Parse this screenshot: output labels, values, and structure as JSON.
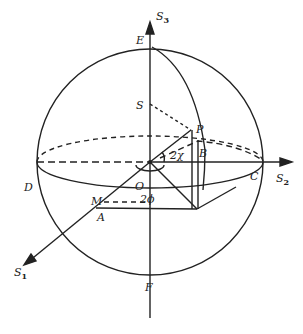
{
  "diagram": {
    "colors": {
      "ink": "#222222",
      "background": "#ffffff"
    },
    "axes": {
      "s1": {
        "main": "S",
        "sub": "1"
      },
      "s2": {
        "main": "S",
        "sub": "2"
      },
      "s3": {
        "main": "S",
        "sub": "3"
      }
    },
    "points": {
      "E": "E",
      "F": "F",
      "D": "D",
      "C": "C",
      "O": "O",
      "S": "S",
      "P": "P",
      "B": "B",
      "M": "M",
      "A": "A"
    },
    "angles": {
      "two_chi": "2χ",
      "two_phi": "2ϕ"
    }
  }
}
